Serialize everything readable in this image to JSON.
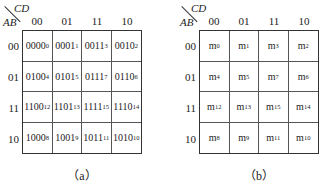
{
  "maps": [
    {
      "id": "a",
      "corner": {
        "col_var": "CD",
        "row_var": "AB"
      },
      "col_headers": [
        "00",
        "01",
        "11",
        "10"
      ],
      "row_headers": [
        "00",
        "01",
        "11",
        "10"
      ],
      "cells": [
        [
          {
            "main": "0000",
            "sub": "0"
          },
          {
            "main": "0001",
            "sub": "1"
          },
          {
            "main": "0011",
            "sub": "3"
          },
          {
            "main": "0010",
            "sub": "2"
          }
        ],
        [
          {
            "main": "0100",
            "sub": "4"
          },
          {
            "main": "0101",
            "sub": "5"
          },
          {
            "main": "0111",
            "sub": "7"
          },
          {
            "main": "0110",
            "sub": "6"
          }
        ],
        [
          {
            "main": "1100",
            "sub": "12"
          },
          {
            "main": "1101",
            "sub": "13"
          },
          {
            "main": "1111",
            "sub": "15"
          },
          {
            "main": "1110",
            "sub": "14"
          }
        ],
        [
          {
            "main": "1000",
            "sub": "8"
          },
          {
            "main": "1001",
            "sub": "9"
          },
          {
            "main": "1011",
            "sub": "11"
          },
          {
            "main": "1010",
            "sub": "10"
          }
        ]
      ],
      "caption": "（a）"
    },
    {
      "id": "b",
      "corner": {
        "col_var": "CD",
        "row_var": "AB"
      },
      "col_headers": [
        "00",
        "01",
        "11",
        "10"
      ],
      "row_headers": [
        "00",
        "01",
        "11",
        "10"
      ],
      "cells": [
        [
          {
            "main": "m",
            "sub": "0"
          },
          {
            "main": "m",
            "sub": "1"
          },
          {
            "main": "m",
            "sub": "3"
          },
          {
            "main": "m",
            "sub": "2"
          }
        ],
        [
          {
            "main": "m",
            "sub": "4"
          },
          {
            "main": "m",
            "sub": "5"
          },
          {
            "main": "m",
            "sub": "7"
          },
          {
            "main": "m",
            "sub": "6"
          }
        ],
        [
          {
            "main": "m",
            "sub": "12"
          },
          {
            "main": "m",
            "sub": "13"
          },
          {
            "main": "m",
            "sub": "15"
          },
          {
            "main": "m",
            "sub": "14"
          }
        ],
        [
          {
            "main": "m",
            "sub": "8"
          },
          {
            "main": "m",
            "sub": "9"
          },
          {
            "main": "m",
            "sub": "11"
          },
          {
            "main": "m",
            "sub": "10"
          }
        ]
      ],
      "caption": "（b）"
    }
  ]
}
